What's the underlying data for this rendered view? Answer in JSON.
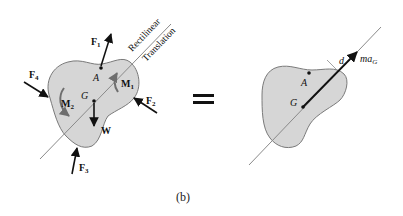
{
  "figure": {
    "caption": "(b)",
    "equals_sign": "=",
    "colors": {
      "body_fill": "#d6d6d6",
      "body_stroke": "#7a7a7a",
      "line": "#8a8a8a",
      "arrow": "#111111",
      "moment_arrow": "#6e6e6e"
    },
    "left_diagram": {
      "line_label_top": "Rectilinear",
      "line_label_bottom": "Translation",
      "points": {
        "A": "A",
        "G": "G"
      },
      "forces": {
        "F1": {
          "main": "F",
          "sub": "1"
        },
        "F2": {
          "main": "F",
          "sub": "2"
        },
        "F3": {
          "main": "F",
          "sub": "3"
        },
        "F4": {
          "main": "F",
          "sub": "4"
        },
        "W": {
          "main": "W"
        }
      },
      "moments": {
        "M1": {
          "main": "M",
          "sub": "1"
        },
        "M2": {
          "main": "M",
          "sub": "2"
        }
      }
    },
    "right_diagram": {
      "points": {
        "A": "A",
        "G": "G"
      },
      "distance_label": "d",
      "inertia_vector": {
        "main": "ma",
        "sub": "G"
      }
    }
  }
}
